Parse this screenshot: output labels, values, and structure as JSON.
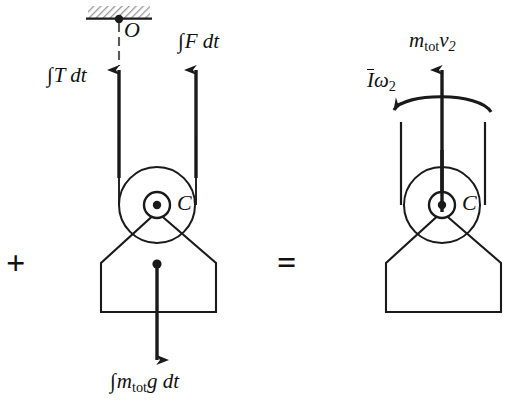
{
  "figure": {
    "type": "free-body / impulse-momentum equation diagram",
    "stroke_color": "#1a1a1a",
    "fill_color": "#ffffff",
    "hatch_color": "#8c8c8c",
    "width": 505,
    "height": 402
  },
  "operators": {
    "plus": "+",
    "equals": "="
  },
  "left_system": {
    "labels": {
      "support_point": "O",
      "center_point": "C",
      "tension_impulse": {
        "integral": "∫",
        "body": "T dt"
      },
      "force_impulse": {
        "integral": "∫",
        "body": "F dt"
      },
      "weight_impulse": {
        "integral": "∫",
        "body": "m",
        "sub": "tot",
        "tail": "g dt"
      }
    },
    "vectors": [
      {
        "name": "tension-impulse-arrow",
        "direction": "up",
        "x": 119,
        "tip_y": 68,
        "tail_y": 178
      },
      {
        "name": "applied-force-impulse-arrow",
        "direction": "up",
        "x": 196,
        "tip_y": 68,
        "tail_y": 178
      },
      {
        "name": "weight-impulse-arrow",
        "direction": "down",
        "x": 157,
        "tip_y": 365,
        "tail_y": 264
      }
    ],
    "geometry": {
      "ceiling_hatch": {
        "x": 88,
        "y": 6,
        "width": 62,
        "height": 13
      },
      "pulley_center": [
        157,
        205
      ],
      "pulley_radius": 38,
      "axle_radius": 13,
      "rope_left_x": 119,
      "rope_right_x": 196,
      "body_left_x": 101,
      "body_right_x": 216,
      "body_shoulder_y": 263,
      "body_bottom_y": 312
    }
  },
  "right_system": {
    "labels": {
      "center_point": "C",
      "angular_momentum": {
        "inertia": "I",
        "omega": "ω",
        "sub": "2"
      },
      "linear_momentum": {
        "mass": "m",
        "sub": "tot",
        "velocity": "v",
        "vsub": "2"
      }
    },
    "vectors": [
      {
        "name": "linear-momentum-arrow",
        "direction": "up",
        "x": 442,
        "tip_y": 68,
        "tail_y": 205
      },
      {
        "name": "angular-momentum-curved-arrow",
        "direction": "counterclockwise",
        "from": [
          490,
          108
        ],
        "to": [
          393,
          107
        ]
      }
    ],
    "geometry": {
      "pulley_center": [
        442,
        205
      ],
      "pulley_radius": 38,
      "axle_radius": 13,
      "stub_left_x": 401,
      "stub_right_x": 485,
      "stub_top_y": 122,
      "stub_bottom_y": 178,
      "body_left_x": 386,
      "body_right_x": 501,
      "body_shoulder_y": 263,
      "body_bottom_y": 312
    }
  }
}
